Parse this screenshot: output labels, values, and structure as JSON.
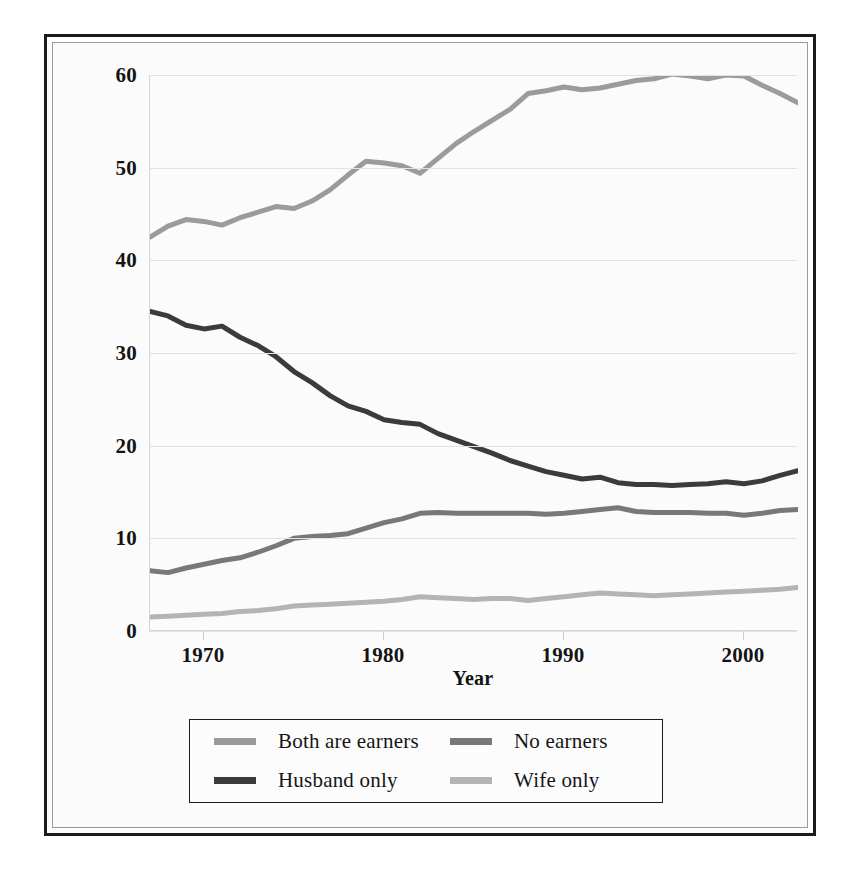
{
  "chart_data": {
    "type": "line",
    "title": "",
    "xlabel": "Year",
    "ylabel": "Percent of Married-Couple Families",
    "xlim": [
      1967,
      2003
    ],
    "ylim": [
      0,
      60
    ],
    "yticks": [
      0,
      10,
      20,
      30,
      40,
      50,
      60
    ],
    "ytick_labels": [
      "0",
      "10",
      "20",
      "30",
      "40",
      "50",
      "60"
    ],
    "xticks": [
      1970,
      1980,
      1990,
      2000
    ],
    "xtick_labels": [
      "1970",
      "1980",
      "1990",
      "2000"
    ],
    "grid": "horizontal",
    "legend_position": "below-axes",
    "x": [
      1967,
      1968,
      1969,
      1970,
      1971,
      1972,
      1973,
      1974,
      1975,
      1976,
      1977,
      1978,
      1979,
      1980,
      1981,
      1982,
      1983,
      1984,
      1985,
      1986,
      1987,
      1988,
      1989,
      1990,
      1991,
      1992,
      1993,
      1994,
      1995,
      1996,
      1997,
      1998,
      1999,
      2000,
      2001,
      2002,
      2003
    ],
    "series": [
      {
        "name": "Both are earners",
        "color": "#9b9b9b",
        "values": [
          42.5,
          43.7,
          44.4,
          44.2,
          43.8,
          44.6,
          45.2,
          45.8,
          45.6,
          46.4,
          47.6,
          49.2,
          50.7,
          50.5,
          50.2,
          49.4,
          51.0,
          52.6,
          53.9,
          55.1,
          56.3,
          58.0,
          58.3,
          58.7,
          58.4,
          58.6,
          59.0,
          59.4,
          59.6,
          60.1,
          59.9,
          59.6,
          60.0,
          59.9,
          58.9,
          58.0,
          57.0
        ]
      },
      {
        "name": "Husband only",
        "color": "#3b3b3b",
        "values": [
          34.5,
          34.0,
          33.0,
          32.6,
          32.9,
          31.7,
          30.8,
          29.6,
          28.0,
          26.8,
          25.4,
          24.3,
          23.7,
          22.8,
          22.5,
          22.3,
          21.3,
          20.6,
          19.9,
          19.2,
          18.4,
          17.8,
          17.2,
          16.8,
          16.4,
          16.6,
          16.0,
          15.8,
          15.8,
          15.7,
          15.8,
          15.9,
          16.1,
          15.9,
          16.2,
          16.8,
          17.3
        ]
      },
      {
        "name": "No earners",
        "color": "#787878",
        "values": [
          6.5,
          6.3,
          6.8,
          7.2,
          7.6,
          7.9,
          8.5,
          9.2,
          10.0,
          10.2,
          10.3,
          10.5,
          11.1,
          11.7,
          12.1,
          12.7,
          12.8,
          12.7,
          12.7,
          12.7,
          12.7,
          12.7,
          12.6,
          12.7,
          12.9,
          13.1,
          13.3,
          12.9,
          12.8,
          12.8,
          12.8,
          12.7,
          12.7,
          12.5,
          12.7,
          13.0,
          13.1
        ]
      },
      {
        "name": "Wife only",
        "color": "#b4b4b4",
        "values": [
          1.5,
          1.6,
          1.7,
          1.8,
          1.9,
          2.1,
          2.2,
          2.4,
          2.7,
          2.8,
          2.9,
          3.0,
          3.1,
          3.2,
          3.4,
          3.7,
          3.6,
          3.5,
          3.4,
          3.5,
          3.5,
          3.3,
          3.5,
          3.7,
          3.9,
          4.1,
          4.0,
          3.9,
          3.8,
          3.9,
          4.0,
          4.1,
          4.2,
          4.3,
          4.4,
          4.5,
          4.7
        ]
      }
    ]
  },
  "legend": {
    "entries": [
      {
        "label": "Both are earners",
        "color": "#9b9b9b"
      },
      {
        "label": "No earners",
        "color": "#787878"
      },
      {
        "label": "Husband only",
        "color": "#3b3b3b"
      },
      {
        "label": "Wife only",
        "color": "#b4b4b4"
      }
    ]
  },
  "axes": {
    "ylabel": "Percent of Married-Couple Families",
    "xlabel": "Year"
  }
}
